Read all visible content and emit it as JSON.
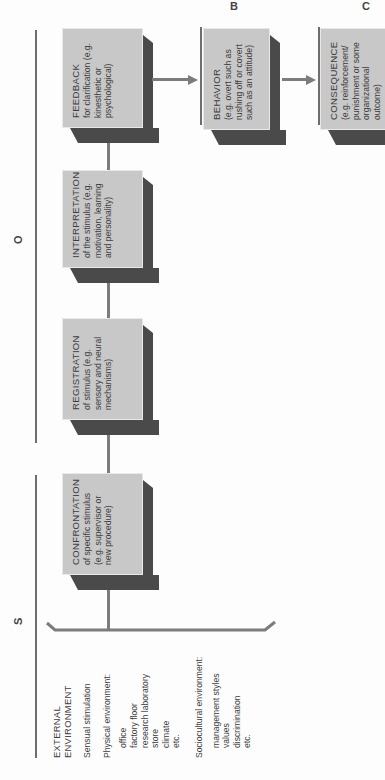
{
  "segments": {
    "S": "S",
    "O": "O",
    "B": "B",
    "C": "C"
  },
  "environment": {
    "title_line1": "EXTERNAL",
    "title_line2": "ENVIRONMENT",
    "sensual": "Sensual stimulation",
    "physical": {
      "label": "Physical environment:",
      "items": [
        "office",
        "factory floor",
        "research laboratory",
        "store",
        "climate",
        "etc."
      ]
    },
    "sociocultural": {
      "label": "Sociocultural environment:",
      "items": [
        "management styles",
        "values",
        "discrimination",
        "etc."
      ]
    }
  },
  "boxes": [
    {
      "title": "CONFRONTATION",
      "desc": "of specific stimulus (e.g. supervisor or new procedure)"
    },
    {
      "title": "REGISTRATION",
      "desc": "of stimulus (e.g. sensory and neural mechanisms)"
    },
    {
      "title": "INTERPRETATION",
      "desc": "of the stimulus (e.g. motivation, learning and personality)"
    },
    {
      "title": "FEEDBACK",
      "desc": "for clarification (e.g. kinesthetic or psychological)"
    },
    {
      "title": "BEHAVIOR",
      "desc": "(e.g. overt such as rushing off or covert such as an attitude)"
    },
    {
      "title": "CONSEQUENCE",
      "desc": "(e.g. reinforcement/ punishment or some organizational outcome)"
    }
  ],
  "colors": {
    "box_face": "#c8c8c8",
    "box_shadow": "#4a4a4a",
    "arrow": "#7c7c7c",
    "rule": "#6e6e6e"
  }
}
